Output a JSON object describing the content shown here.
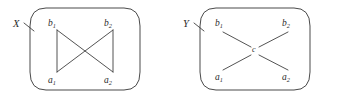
{
  "figure": {
    "caption": "",
    "panels": [
      {
        "id": "panel-x",
        "set_label": "X",
        "vertices": [
          {
            "id": "b1",
            "base": "b",
            "sub": "1",
            "x": 57,
            "y": 30
          },
          {
            "id": "b2",
            "base": "b",
            "sub": "2",
            "x": 113,
            "y": 30
          },
          {
            "id": "a1",
            "base": "a",
            "sub": "1",
            "x": 57,
            "y": 72
          },
          {
            "id": "a2",
            "base": "a",
            "sub": "2",
            "x": 113,
            "y": 72
          }
        ],
        "edges": [
          {
            "from": "b1",
            "to": "a1"
          },
          {
            "from": "b2",
            "to": "a2"
          },
          {
            "from": "b1",
            "to": "a2"
          },
          {
            "from": "b2",
            "to": "a1"
          }
        ],
        "shape_name": "bowtie"
      },
      {
        "id": "panel-y",
        "set_label": "Y",
        "center": {
          "id": "c",
          "base": "c",
          "sub": "",
          "x": 255,
          "y": 51
        },
        "vertices": [
          {
            "id": "b1",
            "base": "b",
            "sub": "1",
            "x": 222,
            "y": 31
          },
          {
            "id": "b2",
            "base": "b",
            "sub": "2",
            "x": 288,
            "y": 31
          },
          {
            "id": "a1",
            "base": "a",
            "sub": "1",
            "x": 222,
            "y": 71
          },
          {
            "id": "a2",
            "base": "a",
            "sub": "2",
            "x": 288,
            "y": 71
          }
        ],
        "edges": [
          {
            "from": "c",
            "to": "b1"
          },
          {
            "from": "c",
            "to": "b2"
          },
          {
            "from": "c",
            "to": "a1"
          },
          {
            "from": "c",
            "to": "a2"
          }
        ],
        "shape_name": "star-four-point"
      }
    ],
    "colors": {
      "stroke": "#3f3f3f",
      "text": "#2b2b2b",
      "background": "#ffffff"
    }
  }
}
